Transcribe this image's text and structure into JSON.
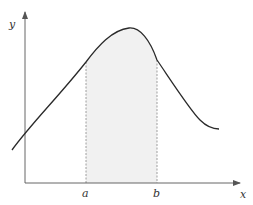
{
  "diagram": {
    "title": "",
    "axes": {
      "x_label": "x",
      "y_label": "y"
    },
    "interval": {
      "a_label": "a",
      "b_label": "b"
    },
    "colors": {
      "axis": "#555555",
      "curve": "#2a2a2a",
      "shade": "#f1f1f1",
      "dashed": "#888888"
    }
  }
}
